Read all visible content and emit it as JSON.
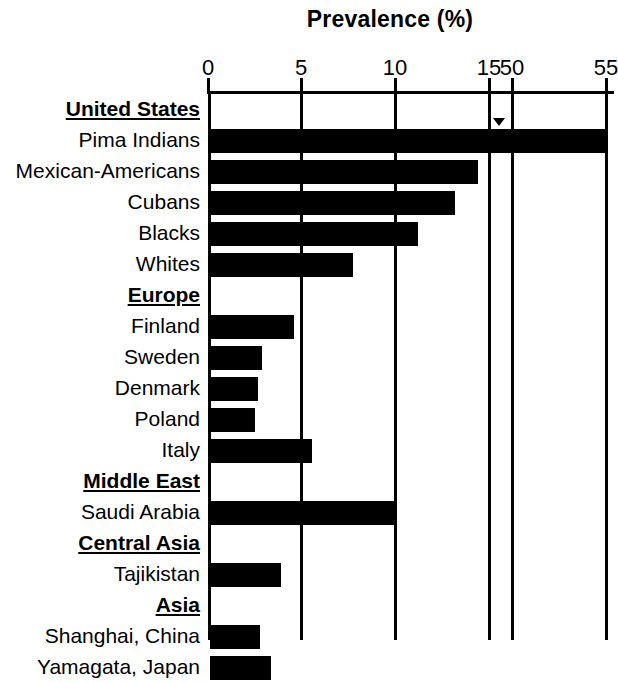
{
  "chart": {
    "title": "Prevalence (%)",
    "axis": {
      "ticks": [
        {
          "label": "0",
          "value": 0,
          "x": 208
        },
        {
          "label": "5",
          "value": 5,
          "x": 301
        },
        {
          "label": "10",
          "value": 10,
          "x": 395
        },
        {
          "label": "15",
          "value": 15,
          "x": 489
        },
        {
          "label": "50",
          "value": 50,
          "x": 512
        },
        {
          "label": "55",
          "value": 55,
          "x": 606
        }
      ],
      "break_between": [
        "15",
        "50"
      ],
      "grid": true
    },
    "colors": {
      "bar": "#000000",
      "axis": "#000000",
      "background": "#ffffff"
    }
  },
  "chart_data": {
    "type": "bar",
    "orientation": "horizontal",
    "title": "Prevalence (%)",
    "xlabel": "Prevalence (%)",
    "ylabel": "",
    "xlim": [
      0,
      55
    ],
    "xticks": [
      0,
      5,
      10,
      15,
      50,
      55
    ],
    "axis_break": [
      15,
      50
    ],
    "grid": true,
    "legend": null,
    "categories": [
      "United States",
      "Pima Indians",
      "Mexican-Americans",
      "Cubans",
      "Blacks",
      "Whites",
      "Europe",
      "Finland",
      "Sweden",
      "Denmark",
      "Poland",
      "Italy",
      "Middle East",
      "Saudi Arabia",
      "Central Asia",
      "Tajikistan",
      "Asia",
      "Shanghai, China",
      "Yamagata, Japan"
    ],
    "values": [
      null,
      55.0,
      14.5,
      13.3,
      11.3,
      7.8,
      null,
      4.6,
      2.9,
      2.7,
      2.5,
      5.6,
      null,
      10.0,
      null,
      3.9,
      null,
      2.8,
      3.4
    ],
    "rows": [
      {
        "label": "United States",
        "type": "header",
        "value": null
      },
      {
        "label": "Pima Indians",
        "type": "bar",
        "value": 55.0,
        "clipped": true
      },
      {
        "label": "Mexican-Americans",
        "type": "bar",
        "value": 14.5
      },
      {
        "label": "Cubans",
        "type": "bar",
        "value": 13.3
      },
      {
        "label": "Blacks",
        "type": "bar",
        "value": 11.3
      },
      {
        "label": "Whites",
        "type": "bar",
        "value": 7.8
      },
      {
        "label": "Europe",
        "type": "header",
        "value": null
      },
      {
        "label": "Finland",
        "type": "bar",
        "value": 4.6
      },
      {
        "label": "Sweden",
        "type": "bar",
        "value": 2.9
      },
      {
        "label": "Denmark",
        "type": "bar",
        "value": 2.7
      },
      {
        "label": "Poland",
        "type": "bar",
        "value": 2.5
      },
      {
        "label": "Italy",
        "type": "bar",
        "value": 5.6
      },
      {
        "label": "Middle East",
        "type": "header",
        "value": null
      },
      {
        "label": "Saudi Arabia",
        "type": "bar",
        "value": 10.0
      },
      {
        "label": "Central Asia",
        "type": "header",
        "value": null
      },
      {
        "label": "Tajikistan",
        "type": "bar",
        "value": 3.9
      },
      {
        "label": "Asia",
        "type": "header",
        "value": null
      },
      {
        "label": "Shanghai, China",
        "type": "bar",
        "value": 2.8
      },
      {
        "label": "Yamagata, Japan",
        "type": "bar",
        "value": 3.4
      }
    ]
  }
}
